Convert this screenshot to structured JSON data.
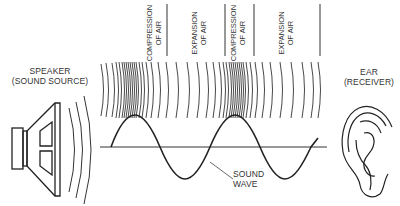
{
  "diagram": {
    "speaker_label": {
      "line1": "SPEAKER",
      "line2": "(SOUND SOURCE)"
    },
    "ear_label": {
      "line1": "EAR",
      "line2": "(RECEIVER)"
    },
    "wave_label": {
      "line1": "SOUND",
      "line2": "WAVE"
    },
    "regions": [
      {
        "line1": "COMPRESSION",
        "line2": "OF AIR"
      },
      {
        "line1": "EXPANSION",
        "line2": "OF AIR"
      },
      {
        "line1": "COMPRESSION",
        "line2": "OF AIR"
      },
      {
        "line1": "EXPANSION",
        "line2": "OF AIR"
      }
    ],
    "stroke_color": "#222222"
  }
}
